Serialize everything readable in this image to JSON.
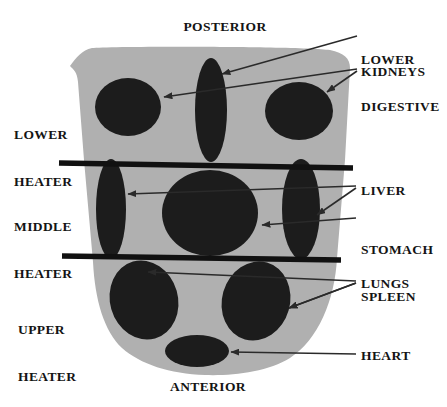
{
  "diagram": {
    "orientation_labels": {
      "posterior": "POSTERIOR",
      "anterior": "ANTERIOR"
    },
    "region_labels": [
      {
        "name": "lower-heater",
        "line1": "LOWER",
        "line2": "HEATER"
      },
      {
        "name": "middle-heater",
        "line1": "MIDDLE",
        "line2": "HEATER"
      },
      {
        "name": "upper-heater",
        "line1": "UPPER",
        "line2": "HEATER"
      }
    ],
    "organ_labels": [
      {
        "name": "lower-digestive",
        "line1": "LOWER",
        "line2": "DIGESTIVE"
      },
      {
        "name": "kidneys",
        "line1": "KIDNEYS",
        "line2": ""
      },
      {
        "name": "liver",
        "line1": "LIVER",
        "line2": ""
      },
      {
        "name": "stomach-spleen",
        "line1": "STOMACH",
        "line2": "SPLEEN"
      },
      {
        "name": "lungs",
        "line1": "LUNGS",
        "line2": ""
      },
      {
        "name": "heart",
        "line1": "HEART",
        "line2": ""
      }
    ],
    "colors": {
      "background": "#ffffff",
      "body_fill": "#b0b0b0",
      "organ_fill": "#1c1c1c",
      "divider_line": "#111111",
      "leader_line": "#2a2a2a",
      "text": "#141414"
    }
  }
}
